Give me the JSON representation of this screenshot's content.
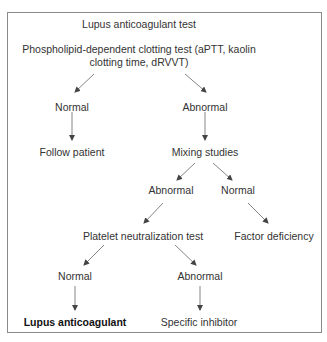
{
  "diagram": {
    "title": "Lupus anticoagulant test",
    "nodes": {
      "root": {
        "line1": "Phospholipid-dependent clotting test (aPTT, kaolin",
        "line2": "clotting time, dRVVT)"
      },
      "root_normal": "Normal",
      "root_abnormal": "Abnormal",
      "follow_patient": "Follow patient",
      "mixing_studies": "Mixing studies",
      "mixing_abnormal": "Abnormal",
      "mixing_normal": "Normal",
      "platelet_neutralization": "Platelet neutralization test",
      "factor_deficiency": "Factor deficiency",
      "pnt_normal": "Normal",
      "pnt_abnormal": "Abnormal",
      "lupus_anticoagulant": "Lupus anticoagulant",
      "specific_inhibitor": "Specific inhibitor"
    },
    "edges": [
      [
        "root",
        "root_normal"
      ],
      [
        "root",
        "root_abnormal"
      ],
      [
        "root_normal",
        "follow_patient"
      ],
      [
        "root_abnormal",
        "mixing_studies"
      ],
      [
        "mixing_studies",
        "mixing_abnormal"
      ],
      [
        "mixing_studies",
        "mixing_normal"
      ],
      [
        "mixing_abnormal",
        "platelet_neutralization"
      ],
      [
        "mixing_normal",
        "factor_deficiency"
      ],
      [
        "platelet_neutralization",
        "pnt_normal"
      ],
      [
        "platelet_neutralization",
        "pnt_abnormal"
      ],
      [
        "pnt_normal",
        "lupus_anticoagulant"
      ],
      [
        "pnt_abnormal",
        "specific_inhibitor"
      ]
    ],
    "colors": {
      "text": "#333333",
      "border": "#8a8a8a",
      "arrow": "#555555"
    }
  }
}
